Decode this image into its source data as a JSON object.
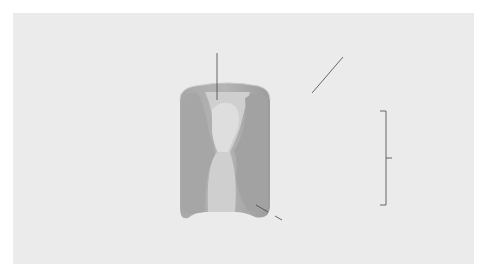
{
  "diagram": {
    "labels": {
      "pore": "pore",
      "cell_surface": "cell surface",
      "plasma_membrane_line1": "plasma",
      "plasma_membrane_line2": "membrane",
      "protein": "protein"
    },
    "colors": {
      "background": "#ebebeb",
      "lipid_head": "#fafafa",
      "lipid_tail": "#d2d2d2",
      "protein_dark": "#9a9a9a",
      "protein_light": "#bdbdbd",
      "pore_light": "#d8d8d8",
      "leader_line": "#444444"
    }
  }
}
